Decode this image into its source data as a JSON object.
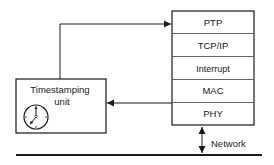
{
  "diagram": {
    "stack": {
      "layers": [
        {
          "label": "PTP"
        },
        {
          "label": "TCP/IP"
        },
        {
          "label": "Interrupt"
        },
        {
          "label": "MAC"
        },
        {
          "label": "PHY"
        }
      ]
    },
    "timestamp_unit": {
      "label_line1": "Timestamping",
      "label_line2": "unit",
      "icon": "clock-icon"
    },
    "network": {
      "label": "Network"
    },
    "colors": {
      "line": "#1a1a1a",
      "background": "#ffffff"
    }
  }
}
